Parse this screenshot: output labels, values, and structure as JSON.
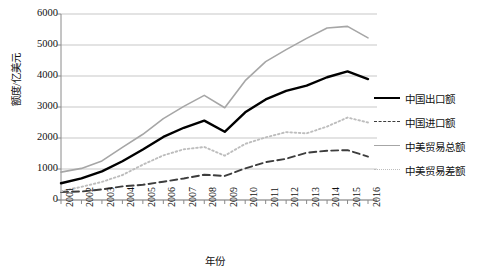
{
  "chart_data": {
    "type": "line",
    "title": "",
    "xlabel": "年份",
    "ylabel": "额度/亿美元",
    "grid": true,
    "legend_position": "right",
    "ylim": [
      0,
      6000
    ],
    "yticks": [
      0,
      1000,
      2000,
      3000,
      4000,
      5000,
      6000
    ],
    "ytick_labels": [
      "0",
      "1000",
      "2000",
      "3000",
      "4000",
      "5000",
      "6000"
    ],
    "categories": [
      "2001",
      "2002",
      "2003",
      "2004",
      "2005",
      "2006",
      "2007",
      "2008",
      "2009",
      "2010",
      "2011",
      "2012",
      "2013",
      "2014",
      "2015",
      "2016"
    ],
    "series": [
      {
        "name": "中国出口额",
        "style": "solid",
        "color": "#000000",
        "values": [
          540,
          700,
          925,
          1250,
          1630,
          2035,
          2330,
          2560,
          2200,
          2830,
          3245,
          3520,
          3690,
          3960,
          4150,
          3900
        ]
      },
      {
        "name": "中国进口额",
        "style": "dashed",
        "color": "#3d3d3d",
        "values": [
          260,
          275,
          340,
          440,
          490,
          590,
          695,
          815,
          775,
          1020,
          1220,
          1330,
          1525,
          1590,
          1610,
          1400
        ]
      },
      {
        "name": "中美贸易总额",
        "style": "solid",
        "color": "#a6a6a6",
        "values": [
          900,
          1020,
          1260,
          1700,
          2120,
          2625,
          3020,
          3375,
          2975,
          3850,
          4465,
          4850,
          5215,
          5550,
          5600,
          5230
        ]
      },
      {
        "name": "中美贸易差额",
        "style": "dotted",
        "color": "#bdbdbd",
        "values": [
          280,
          425,
          585,
          805,
          1140,
          1440,
          1635,
          1710,
          1430,
          1810,
          2020,
          2190,
          2150,
          2370,
          2660,
          2500
        ]
      }
    ]
  },
  "axes": {
    "y_title": "额度/亿美元",
    "x_title": "年份"
  },
  "legend": {
    "items": [
      {
        "label": "中国出口额",
        "swatch": "solid-black-line-icon"
      },
      {
        "label": "中国进口额",
        "swatch": "dashed-black-line-icon"
      },
      {
        "label": "中美贸易总额",
        "swatch": "solid-gray-line-icon"
      },
      {
        "label": "中美贸易差额",
        "swatch": "dotted-gray-line-icon"
      }
    ]
  },
  "colors": {
    "export_line": "#000000",
    "import_line": "#3d3d3d",
    "total_line": "#a6a6a6",
    "balance_line": "#bdbdbd",
    "grid": "#b9b9b9",
    "axis": "#8a8a8a",
    "background": "#ffffff"
  }
}
